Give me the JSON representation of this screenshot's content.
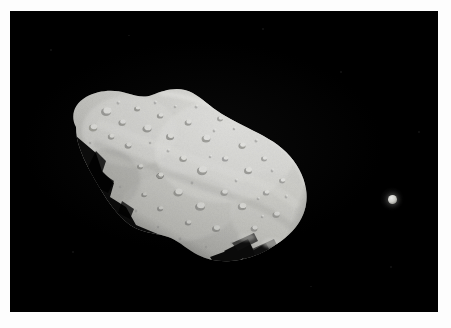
{
  "image": {
    "type": "astronomical-photograph",
    "subject": "asteroid with small natural satellite",
    "background_color": "#000000",
    "border_color": "#fdfdfd",
    "width": 451,
    "height": 328,
    "photo_area": {
      "left": 10,
      "top": 11,
      "width": 428,
      "height": 301
    }
  },
  "objects": {
    "asteroid": {
      "name": "asteroid-body",
      "description": "large irregular elongated cratered body, lit from upper right, oriented diagonally from lower-right to upper-left",
      "bounding_box": {
        "left": 55,
        "top": 86,
        "width": 255,
        "height": 180
      },
      "highlight_color": "#d9d9d6",
      "midtone_color": "#b4b4b0",
      "shadow_color": "#3a3a38",
      "terminator": "jagged shadow edge along lower-left flank and lower-right tip",
      "surface_features": "dense small impact craters across the sunlit face"
    },
    "moon": {
      "name": "moon-body",
      "description": "small bright round satellite isolated in the dark field to the right of the asteroid",
      "center": {
        "x": 392,
        "y": 199
      },
      "diameter_px": 9,
      "highlight_color": "#e8e8e6",
      "shadow_color": "#5c5c58"
    }
  },
  "scene": {
    "sky_color": "#000000",
    "light_direction": "upper-right",
    "specks_visible": true
  }
}
